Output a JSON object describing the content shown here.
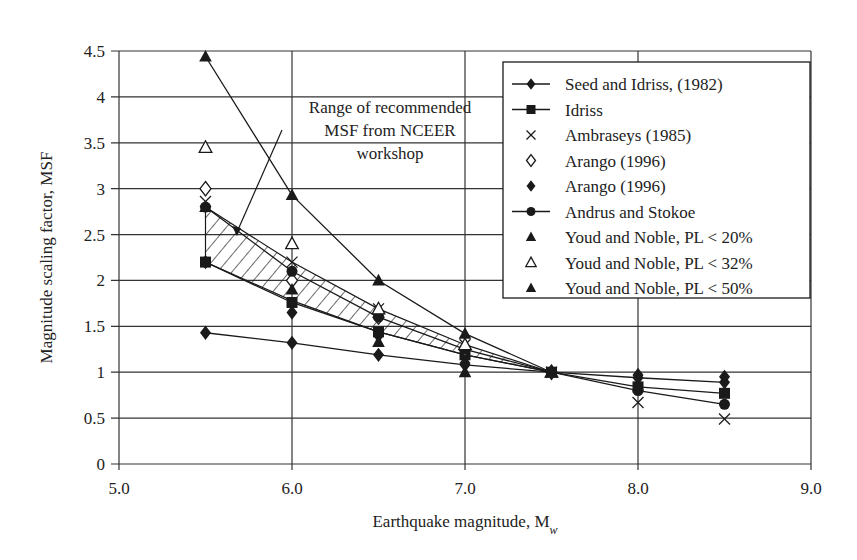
{
  "chart_data": {
    "type": "line",
    "title": "",
    "xlabel": "Earthquake magnitude, M",
    "xlabel_sub": "w",
    "ylabel": "Magnitude scaling factor, MSF",
    "xlim": [
      5.0,
      9.0
    ],
    "ylim": [
      0,
      4.5
    ],
    "x_ticks": [
      "5.0",
      "6.0",
      "7.0",
      "8.0",
      "9.0"
    ],
    "y_ticks": [
      "0",
      "0.5",
      "1",
      "1.5",
      "2",
      "2.5",
      "3",
      "3.5",
      "4",
      "4.5"
    ],
    "grid": true,
    "legend_position": "upper right",
    "annotation": {
      "lines": [
        "Range of recommended",
        "MSF from NCEER",
        "workshop"
      ],
      "target": "hatched band"
    },
    "band": {
      "name": "Range of recommended MSF from NCEER workshop",
      "upper": [
        [
          5.5,
          2.8
        ],
        [
          6.0,
          2.2
        ],
        [
          6.5,
          1.69
        ],
        [
          7.0,
          1.3
        ],
        [
          7.5,
          1.0
        ]
      ],
      "lower": [
        [
          5.5,
          2.2
        ],
        [
          6.0,
          1.78
        ],
        [
          6.5,
          1.44
        ],
        [
          7.0,
          1.19
        ],
        [
          7.5,
          1.0
        ]
      ]
    },
    "series": [
      {
        "name": "Seed and Idriss, (1982)",
        "marker": "filled-diamond",
        "line": true,
        "x": [
          5.5,
          6.0,
          6.5,
          7.0,
          7.5,
          8.0,
          8.5
        ],
        "values": [
          1.43,
          1.32,
          1.19,
          1.08,
          1.0,
          0.94,
          0.89
        ]
      },
      {
        "name": "Idriss",
        "marker": "filled-square",
        "line": true,
        "x": [
          5.5,
          6.0,
          6.5,
          7.0,
          7.5,
          8.0,
          8.5
        ],
        "values": [
          2.2,
          1.76,
          1.44,
          1.19,
          1.0,
          0.84,
          0.77
        ]
      },
      {
        "name": "Ambraseys (1985)",
        "marker": "x",
        "line": false,
        "x": [
          5.5,
          6.0,
          6.5,
          7.0,
          7.5,
          8.0,
          8.5
        ],
        "values": [
          2.86,
          2.2,
          1.69,
          1.3,
          1.0,
          0.67,
          0.49
        ]
      },
      {
        "name": "Arango (1996)",
        "marker": "open-diamond",
        "line": false,
        "x": [
          5.5,
          6.0,
          6.5,
          7.0,
          7.5
        ],
        "values": [
          3.0,
          2.0,
          1.6,
          1.25,
          1.0
        ]
      },
      {
        "name": "Arango (1996)",
        "marker": "filled-diamond",
        "line": false,
        "x": [
          5.5,
          6.0,
          6.5,
          7.0,
          7.5,
          8.0,
          8.5
        ],
        "values": [
          2.2,
          1.65,
          1.4,
          1.1,
          1.0,
          0.97,
          0.95
        ]
      },
      {
        "name": "Andrus and Stokoe",
        "marker": "filled-circle",
        "line": true,
        "x": [
          5.5,
          6.0,
          6.5,
          7.0,
          7.5,
          8.0,
          8.5
        ],
        "values": [
          2.8,
          2.1,
          1.6,
          1.25,
          1.0,
          0.8,
          0.65
        ]
      },
      {
        "name": "Youd and Noble, PL < 20%",
        "marker": "filled-triangle",
        "line": true,
        "x": [
          5.5,
          6.0,
          6.5,
          7.0,
          7.5
        ],
        "values": [
          4.44,
          2.93,
          2.0,
          1.42,
          1.0
        ]
      },
      {
        "name": "Youd and Noble, PL < 32%",
        "marker": "open-triangle",
        "line": false,
        "x": [
          5.5,
          6.0,
          6.5,
          7.0,
          7.5
        ],
        "values": [
          3.45,
          2.4,
          1.69,
          1.3,
          1.0
        ]
      },
      {
        "name": "Youd and Noble, PL < 50%",
        "marker": "filled-triangle",
        "line": false,
        "x": [
          5.5,
          6.0,
          6.5,
          7.0,
          7.5
        ],
        "values": [
          2.8,
          1.9,
          1.33,
          1.0,
          1.0
        ]
      }
    ]
  },
  "legend": {
    "items": [
      {
        "label": "Seed and Idriss, (1982)",
        "marker": "filled-diamond",
        "line": true
      },
      {
        "label": "Idriss",
        "marker": "filled-square",
        "line": true
      },
      {
        "label": "Ambraseys (1985)",
        "marker": "x",
        "line": false
      },
      {
        "label": "Arango (1996)",
        "marker": "open-diamond",
        "line": false
      },
      {
        "label": "Arango (1996)",
        "marker": "filled-diamond",
        "line": false
      },
      {
        "label": "Andrus and Stokoe",
        "marker": "filled-circle",
        "line": true
      },
      {
        "label": "Youd and Noble, PL < 20%",
        "marker": "filled-triangle",
        "line": false
      },
      {
        "label": "Youd and Noble, PL < 32%",
        "marker": "open-triangle",
        "line": false
      },
      {
        "label": "Youd and Noble, PL < 50%",
        "marker": "filled-triangle",
        "line": false
      }
    ]
  },
  "colors": {
    "ink": "#1a1a1a",
    "grid": "#333333",
    "background": "#ffffff"
  }
}
